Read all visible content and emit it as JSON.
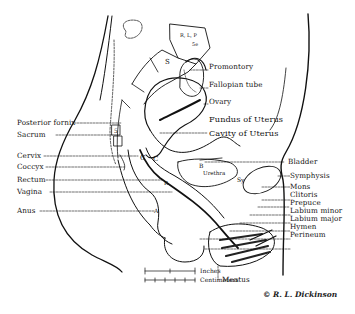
{
  "diagram": {
    "type": "anatomical illustration",
    "labels_left": {
      "posterior_fornix": "Posterior fornix",
      "sacrum": "Sacrum",
      "cervix": "Cervix",
      "coccyx": "Coccyx",
      "rectum": "Rectum",
      "vagina": "Vagina",
      "anus": "Anus"
    },
    "labels_right": {
      "promontory": "Promontory",
      "fallopian_tube": "Fallopian tube",
      "ovary": "Ovary",
      "fundus": "Fundus of Uterus",
      "cavity": "Cavity of Uterus",
      "bladder": "Bladder",
      "symphysis": "Symphysis",
      "mons": "Mons",
      "clitoris": "Clitoris",
      "prepuce": "Prepuce",
      "labium_minor": "Labium minor",
      "labium_major": "Labium major",
      "hymen": "Hymen",
      "perineum": "Perineum"
    },
    "labels_bottom": {
      "meatus": "Meatus"
    },
    "inner_labels": {
      "vertebra": "R, L, P",
      "vertebra_sub": "5e",
      "s1": "S",
      "s5": "5",
      "c1": "C",
      "c2": "C",
      "b": "B",
      "urethra": "Urethra",
      "sy": "Sy",
      "r": "R",
      "a": "A"
    },
    "scale": {
      "inches": "Inches",
      "centimeters": "Centimeters"
    },
    "credit": "© R. L. Dickinson"
  }
}
